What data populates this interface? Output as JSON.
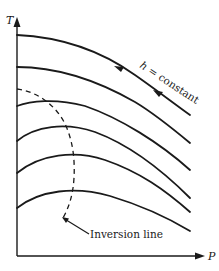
{
  "diagram": {
    "type": "isenthalpic-curves-T-vs-P",
    "axes": {
      "x_label": "P",
      "y_label": "T"
    },
    "annotations": {
      "curve_label": "h = constant",
      "curve_label_h": "h",
      "curve_label_rest": " = constant",
      "inversion_label": "Inversion line"
    },
    "curves": [
      {
        "name": "isenthalp-1",
        "style": "solid",
        "has_direction_arrows": true
      },
      {
        "name": "isenthalp-2",
        "style": "solid"
      },
      {
        "name": "isenthalp-3",
        "style": "solid"
      },
      {
        "name": "isenthalp-4",
        "style": "solid"
      },
      {
        "name": "isenthalp-5",
        "style": "solid"
      },
      {
        "name": "isenthalp-6",
        "style": "solid"
      }
    ],
    "inversion_line": {
      "style": "dashed"
    },
    "colors": {
      "ink": "#1a1a1a",
      "background": "#ffffff"
    }
  }
}
